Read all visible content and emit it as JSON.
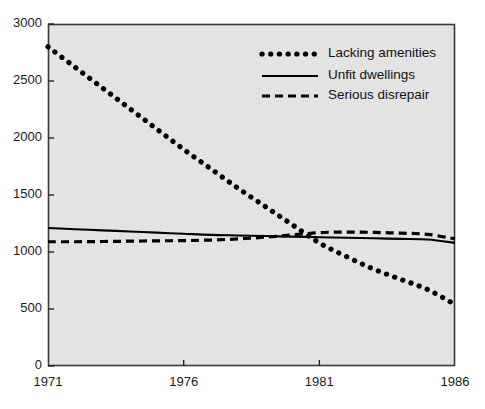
{
  "chart_data": {
    "type": "line",
    "title": "",
    "subtitle": "",
    "xlabel": "",
    "ylabel": "",
    "xlim": [
      1971,
      1986
    ],
    "ylim": [
      0,
      3000
    ],
    "xticks": [
      1971,
      1976,
      1981,
      1986
    ],
    "xtick_labels": [
      "1971",
      "1976",
      "1981",
      "1986"
    ],
    "yticks": [
      0,
      500,
      1000,
      1500,
      2000,
      2500,
      3000
    ],
    "ytick_labels": [
      "0",
      "500",
      "1000",
      "1500",
      "2000",
      "2500",
      "3000"
    ],
    "grid": false,
    "legend_position": "top-right",
    "plot_background": "#e3e3e3",
    "figure_background": "#ffffff",
    "line_color": "#000000",
    "x": [
      1971,
      1972,
      1973,
      1974,
      1975,
      1976,
      1977,
      1978,
      1979,
      1980,
      1981,
      1982,
      1983,
      1984,
      1985,
      1986
    ],
    "series": [
      {
        "name": "Lacking amenities",
        "style": "dotted",
        "values": [
          2800,
          2620,
          2440,
          2260,
          2080,
          1900,
          1730,
          1560,
          1400,
          1240,
          1080,
          960,
          850,
          760,
          670,
          540
        ]
      },
      {
        "name": "Unfit dwellings",
        "style": "solid",
        "values": [
          1210,
          1200,
          1190,
          1180,
          1170,
          1160,
          1150,
          1145,
          1140,
          1135,
          1130,
          1125,
          1120,
          1115,
          1110,
          1080
        ]
      },
      {
        "name": "Serious disrepair",
        "style": "dashed",
        "values": [
          1090,
          1090,
          1092,
          1095,
          1098,
          1100,
          1105,
          1115,
          1130,
          1150,
          1170,
          1175,
          1172,
          1165,
          1155,
          1115
        ]
      }
    ]
  },
  "legend": {
    "items": [
      {
        "label": "Lacking amenities",
        "style": "dotted"
      },
      {
        "label": "Unfit dwellings",
        "style": "solid"
      },
      {
        "label": "Serious disrepair",
        "style": "dashed"
      }
    ]
  }
}
